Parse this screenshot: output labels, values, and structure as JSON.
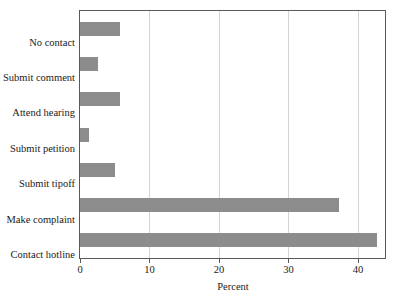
{
  "figure": {
    "cut_off_header_text": "",
    "background": "#ffffff",
    "bar_color": "#8c8c8c",
    "axis_color": "#5a5a5a",
    "grid_color": "#d4d4d4"
  },
  "chart_data": {
    "type": "bar",
    "orientation": "horizontal",
    "title": "",
    "subtitle": "",
    "xlabel": "Percent",
    "ylabel": "",
    "categories": [
      "No contact",
      "Submit comment",
      "Attend hearing",
      "Submit petition",
      "Submit tipoff",
      "Make complaint",
      "Contact hotline"
    ],
    "values": [
      5.7,
      2.6,
      5.8,
      1.3,
      5.0,
      37.3,
      42.7
    ],
    "xlim": [
      0,
      43.9
    ],
    "xticks": [
      0,
      10,
      20,
      30,
      40
    ],
    "xticklabels": [
      "0",
      "10",
      "20",
      "30",
      "40"
    ],
    "grid": "vertical",
    "legend": null,
    "annotations": []
  }
}
